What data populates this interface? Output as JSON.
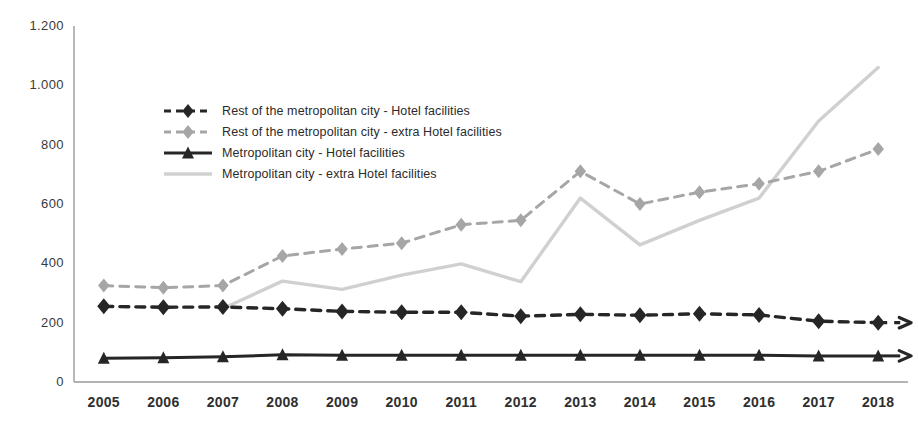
{
  "chart_data": {
    "type": "line",
    "title": "",
    "subtitle": "",
    "xlabel": "",
    "ylabel": "",
    "categories": [
      "2005",
      "2006",
      "2007",
      "2008",
      "2009",
      "2010",
      "2011",
      "2012",
      "2013",
      "2014",
      "2015",
      "2016",
      "2017",
      "2018"
    ],
    "x": [
      2005,
      2006,
      2007,
      2008,
      2009,
      2010,
      2011,
      2012,
      2013,
      2014,
      2015,
      2016,
      2017,
      2018
    ],
    "ylim": [
      0,
      1200
    ],
    "ytick_values": [
      0,
      200,
      400,
      600,
      800,
      1000,
      1200
    ],
    "ytick_labels": [
      "0",
      "200",
      "400",
      "600",
      "800",
      "1.000",
      "1.200"
    ],
    "grid": false,
    "legend_position": "upper left",
    "series": [
      {
        "name": "Rest of the metropolitan city - Hotel facilities",
        "key": "rest_hotel",
        "color": "#262626",
        "line_style": "dashed",
        "marker": "diamond",
        "values": [
          255,
          252,
          253,
          247,
          238,
          235,
          235,
          222,
          228,
          225,
          230,
          226,
          205,
          200
        ]
      },
      {
        "name": "Rest of the metropolitan city - extra Hotel facilities",
        "key": "rest_extra_hotel",
        "color": "#a6a6a6",
        "line_style": "dashed",
        "marker": "diamond",
        "values": [
          325,
          318,
          325,
          425,
          448,
          468,
          530,
          545,
          710,
          600,
          640,
          668,
          710,
          785
        ]
      },
      {
        "name": "Metropolitan city - Hotel facilities",
        "key": "metro_hotel",
        "color": "#262626",
        "line_style": "solid",
        "marker": "triangle",
        "values": [
          80,
          82,
          85,
          92,
          90,
          90,
          90,
          90,
          90,
          90,
          90,
          90,
          88,
          88
        ]
      },
      {
        "name": "Metropolitan city - extra Hotel facilities",
        "key": "metro_extra_hotel",
        "color": "#d0d0d0",
        "line_style": "solid",
        "marker": "none",
        "values": [
          null,
          null,
          248,
          340,
          312,
          360,
          398,
          338,
          620,
          462,
          545,
          620,
          880,
          1060
        ]
      }
    ]
  },
  "legend": {
    "items": [
      {
        "label": "Rest of the metropolitan city - Hotel facilities"
      },
      {
        "label": "Rest of the metropolitan city - extra Hotel facilities"
      },
      {
        "label": "Metropolitan city - Hotel facilities"
      },
      {
        "label": "Metropolitan city - extra Hotel facilities"
      }
    ]
  },
  "axes": {
    "y_labels": [
      "1.200",
      "1.000",
      "800",
      "600",
      "400",
      "200",
      "0"
    ],
    "x_labels": [
      "2005",
      "2006",
      "2007",
      "2008",
      "2009",
      "2010",
      "2011",
      "2012",
      "2013",
      "2014",
      "2015",
      "2016",
      "2017",
      "2018"
    ]
  }
}
